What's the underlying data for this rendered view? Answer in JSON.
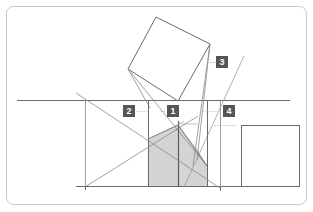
{
  "diagram": {
    "type": "perspective-construction",
    "colors": {
      "frame_stroke": "#c8c8c8",
      "line_stroke": "#8a8a8a",
      "dark_line_stroke": "#5a5a5a",
      "shade_fill": "#d4d4d4",
      "badge_bg": "#555555",
      "badge_text": "#ffffff"
    },
    "badges": [
      {
        "id": "badge-1",
        "label": "1"
      },
      {
        "id": "badge-2",
        "label": "2"
      },
      {
        "id": "badge-3",
        "label": "3"
      },
      {
        "id": "badge-4",
        "label": "4"
      }
    ]
  }
}
